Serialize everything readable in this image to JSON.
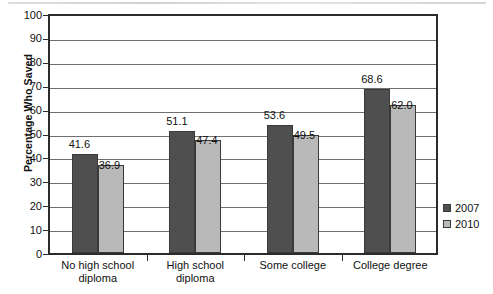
{
  "chart_data": {
    "type": "bar",
    "title": "",
    "xlabel": "",
    "ylabel": "Percentage Who Saved",
    "ylim": [
      0,
      100
    ],
    "ytick_step": 10,
    "grid": true,
    "legend_position": "right",
    "categories": [
      "No high school\ndiploma",
      "High school\ndiploma",
      "Some college",
      "College degree"
    ],
    "series": [
      {
        "name": "2007",
        "color": "#4f4f4f",
        "values": [
          41.6,
          51.1,
          53.6,
          68.6
        ],
        "labels": [
          "41.6",
          "51.1",
          "53.6",
          "68.6"
        ]
      },
      {
        "name": "2010",
        "color": "#b9b9b9",
        "values": [
          36.9,
          47.4,
          49.5,
          62.0
        ],
        "labels": [
          "36.9",
          "47.4",
          "49.5",
          "62.0"
        ]
      }
    ],
    "ytick_labels": [
      "100",
      "90",
      "80",
      "70",
      "60",
      "50",
      "40",
      "30",
      "20",
      "10",
      "0"
    ]
  },
  "legend": {
    "items": [
      {
        "label": "2007",
        "color": "#4f4f4f"
      },
      {
        "label": "2010",
        "color": "#b9b9b9"
      }
    ]
  }
}
